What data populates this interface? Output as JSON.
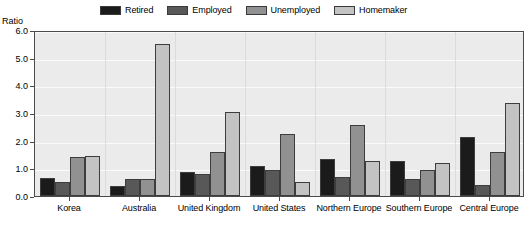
{
  "axis_title": "Ratio",
  "legend": {
    "position": "top",
    "entries": [
      {
        "label": "Retired",
        "color": "#1b1b1b",
        "icon": "legend-swatch-icon"
      },
      {
        "label": "Employed",
        "color": "#585858",
        "icon": "legend-swatch-icon"
      },
      {
        "label": "Unemployed",
        "color": "#919191",
        "icon": "legend-swatch-icon"
      },
      {
        "label": "Homemaker",
        "color": "#c3c3c3",
        "icon": "legend-swatch-icon"
      }
    ]
  },
  "y_ticks": [
    "0.0",
    "1.0",
    "2.0",
    "3.0",
    "4.0",
    "5.0",
    "6.0"
  ],
  "chart_data": {
    "type": "bar",
    "title": "",
    "subtitle": "",
    "xlabel": "",
    "ylabel": "Ratio",
    "ylim": [
      0.0,
      6.0
    ],
    "ytick_step": 1.0,
    "grid": true,
    "legend_position": "top",
    "categories": [
      "Korea",
      "Australia",
      "United Kingdom",
      "United States",
      "Northern Europe",
      "Southern Europe",
      "Central Europe"
    ],
    "series": [
      {
        "name": "Retired",
        "color": "#1b1b1b",
        "values": [
          0.65,
          0.35,
          0.85,
          1.1,
          1.35,
          1.25,
          2.15
        ]
      },
      {
        "name": "Employed",
        "color": "#585858",
        "values": [
          0.5,
          0.6,
          0.8,
          0.95,
          0.7,
          0.6,
          0.4
        ]
      },
      {
        "name": "Unemployed",
        "color": "#919191",
        "values": [
          1.4,
          0.6,
          1.6,
          2.25,
          2.55,
          0.95,
          1.6
        ]
      },
      {
        "name": "Homemaker",
        "color": "#c3c3c3",
        "values": [
          1.45,
          5.5,
          3.05,
          0.5,
          1.25,
          1.2,
          3.35
        ]
      }
    ]
  }
}
